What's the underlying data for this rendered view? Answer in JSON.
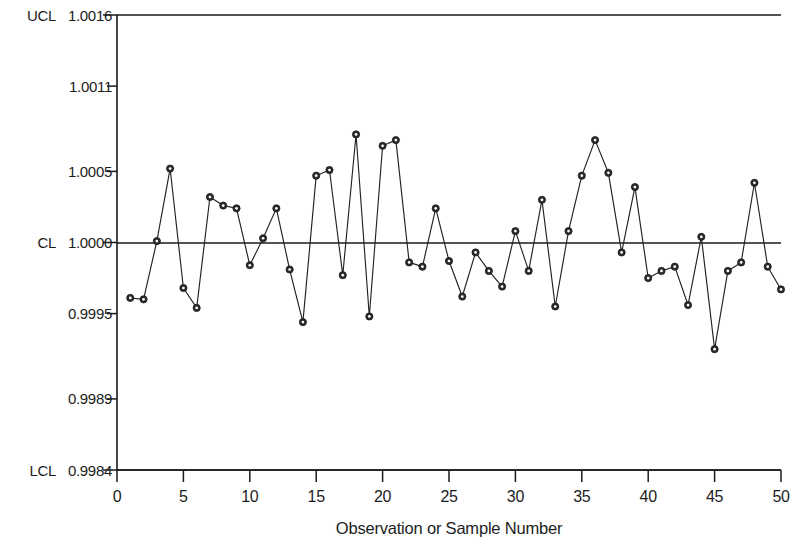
{
  "chart_data": {
    "type": "line",
    "title": "",
    "subtitle": "",
    "xlabel": "Observation or Sample Number",
    "ylabel": "",
    "grid": false,
    "legend": "none",
    "xlim": [
      0,
      50
    ],
    "ylim": [
      0.9984,
      1.0016
    ],
    "x": [
      1,
      2,
      3,
      4,
      5,
      6,
      7,
      8,
      9,
      10,
      11,
      12,
      13,
      14,
      15,
      16,
      17,
      18,
      19,
      20,
      21,
      22,
      23,
      24,
      25,
      26,
      27,
      28,
      29,
      30,
      31,
      32,
      33,
      34,
      35,
      36,
      37,
      38,
      39,
      40,
      41,
      42,
      43,
      44,
      45,
      46,
      47,
      48,
      49,
      50
    ],
    "values": [
      0.99961,
      0.9996,
      1.00001,
      1.00052,
      0.99968,
      0.99954,
      1.00032,
      1.00026,
      1.00024,
      0.99984,
      1.00003,
      1.00024,
      0.99981,
      0.99944,
      1.00047,
      1.00051,
      0.99977,
      1.00076,
      0.99948,
      1.00068,
      1.00072,
      0.99986,
      0.99983,
      1.00024,
      0.99987,
      0.99962,
      0.99993,
      0.9998,
      0.99969,
      1.00008,
      0.9998,
      1.0003,
      0.99955,
      1.00008,
      1.00047,
      1.00072,
      1.00049,
      0.99993,
      1.00039,
      0.99975,
      0.9998,
      0.99983,
      0.99956,
      1.00004,
      0.99925,
      0.9998,
      0.99986,
      1.00042,
      0.99983,
      0.99967
    ],
    "series": [
      {
        "name": "Individual measurement",
        "marker": "filled-circle",
        "line_color": "#222222"
      }
    ],
    "control_limits": {
      "ucl": {
        "label": "UCL",
        "value": 1.0016,
        "display": "1.0016"
      },
      "cl": {
        "label": "CL",
        "value": 1.0,
        "display": "1.0000"
      },
      "lcl": {
        "label": "LCL",
        "value": 0.9984,
        "display": "0.9984"
      }
    },
    "y_ticks": [
      {
        "value": 1.0016,
        "label": "1.0016",
        "prefix": "UCL"
      },
      {
        "value": 1.0011,
        "label": "1.0011",
        "prefix": ""
      },
      {
        "value": 1.0005,
        "label": "1.0005",
        "prefix": ""
      },
      {
        "value": 1.0,
        "label": "1.0000",
        "prefix": "CL"
      },
      {
        "value": 0.9995,
        "label": "0.9995",
        "prefix": ""
      },
      {
        "value": 0.9989,
        "label": "0.9989",
        "prefix": ""
      },
      {
        "value": 0.9984,
        "label": "0.9984",
        "prefix": "LCL"
      }
    ],
    "x_ticks": [
      {
        "value": 0,
        "label": "0"
      },
      {
        "value": 5,
        "label": "5"
      },
      {
        "value": 10,
        "label": "10"
      },
      {
        "value": 15,
        "label": "15"
      },
      {
        "value": 20,
        "label": "20"
      },
      {
        "value": 25,
        "label": "25"
      },
      {
        "value": 30,
        "label": "30"
      },
      {
        "value": 35,
        "label": "35"
      },
      {
        "value": 40,
        "label": "40"
      },
      {
        "value": 45,
        "label": "45"
      },
      {
        "value": 50,
        "label": "50"
      }
    ],
    "colors": {
      "line": "#222222",
      "marker": "#2b2b2b",
      "axis": "#1a1a1a",
      "text": "#1d1d1d",
      "background": "#ffffff"
    }
  }
}
